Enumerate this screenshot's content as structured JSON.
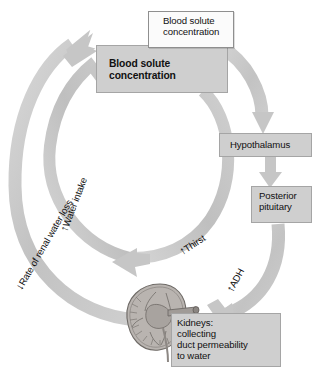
{
  "diagram": {
    "colors": {
      "box_fill_gray": "#cfcfcf",
      "box_fill_white": "#fbfbfb",
      "box_border": "#9a9a9a",
      "arrow_fill": "#c4c4c4",
      "arrow_fill_light": "#d3d3d3",
      "text": "#111111",
      "background": "#ffffff",
      "kidney_fill": "#b5b0ac"
    },
    "boxes": {
      "blood_solute_increase": {
        "text": "Blood solute\nconcentration",
        "marker": "↑",
        "style": "white"
      },
      "blood_solute": {
        "text": "Blood solute\nconcentration",
        "style": "gray"
      },
      "hypothalamus": {
        "text": "Hypothalamus",
        "style": "gray"
      },
      "posterior_pituitary": {
        "text": "Posterior\npituitary",
        "style": "gray"
      },
      "kidneys": {
        "text": "Kidneys:\n   collecting\nduct permeability\nto water",
        "marker": "↑",
        "style": "gray"
      }
    },
    "arc_labels": {
      "thirst": {
        "marker": "↑",
        "text": "Thirst"
      },
      "adh": {
        "marker": "↑",
        "text": "ADH"
      },
      "water_intake": {
        "marker": "↑",
        "text": "Water intake"
      },
      "renal_water_loss": {
        "marker": "↓",
        "text": "Rate of renal water loss"
      }
    },
    "illustration": {
      "kidney": "kidney-cross-section"
    }
  }
}
